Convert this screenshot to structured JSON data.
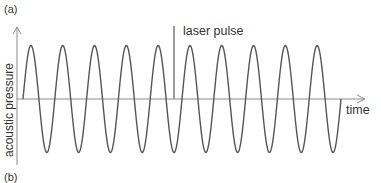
{
  "panels": {
    "a_label": "(a)",
    "b_label": "(b)"
  },
  "axes": {
    "y_label": "acoustic pressure",
    "x_label": "time"
  },
  "annotation": {
    "laser_label": "laser pulse"
  },
  "colors": {
    "wave": "#555555",
    "axis": "#888888",
    "pulse": "#999999",
    "text": "#333333"
  },
  "chart_data": {
    "type": "line",
    "title": "",
    "xlabel": "time",
    "ylabel": "acoustic pressure",
    "series": [
      {
        "name": "acoustic pressure",
        "periods": 10,
        "amplitude": 1,
        "phase_start": 0
      }
    ],
    "annotations": [
      {
        "label": "laser pulse",
        "x_period": 4.75
      }
    ],
    "grid": false,
    "legend": "none"
  }
}
